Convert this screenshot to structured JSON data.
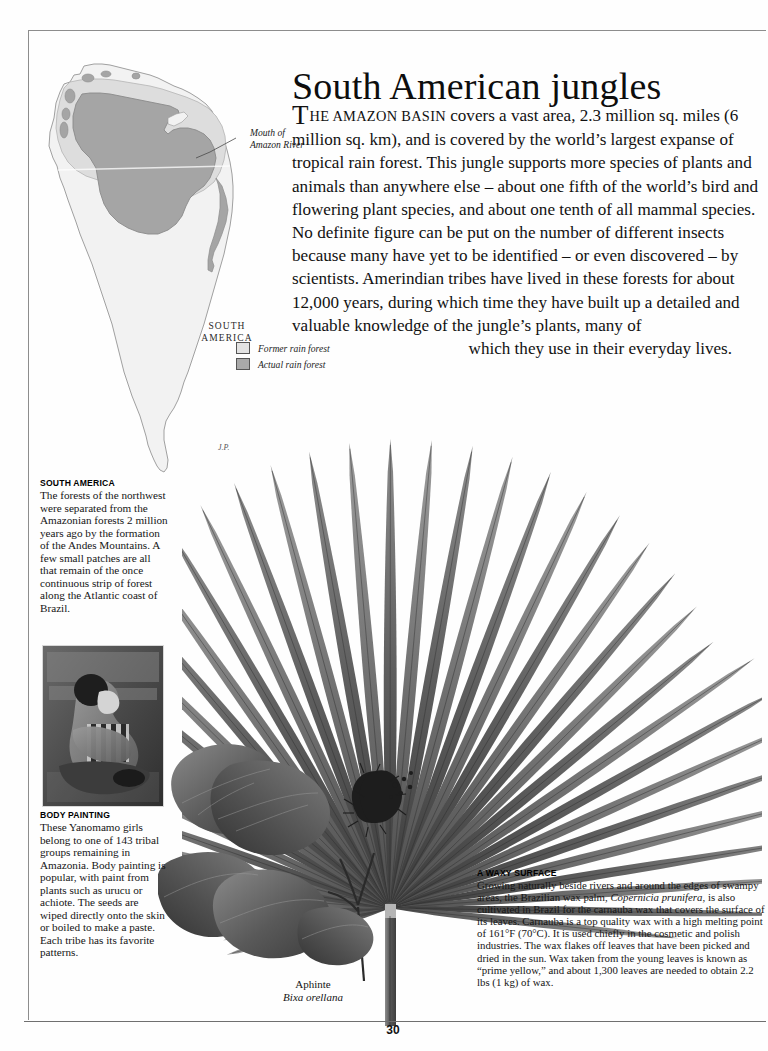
{
  "page": {
    "number": "30",
    "headline": "South American jungles"
  },
  "intro": {
    "dropcap": "T",
    "smallcaps": "HE AMAZON BASIN",
    "body": " covers a vast area, 2.3 million sq. miles (6 million sq. km), and is covered by the world’s largest expanse of tropical rain forest. This jungle supports more species of plants and animals than anywhere else – about one fifth of the world’s bird and flowering plant species, and about one tenth of all mammal species. No definite figure can be put on the number of different insects because many have yet to be identified – or even discovered – by scientists. Amerindian tribes have lived in these forests for about 12,000 years, during which time they have built up a detailed and valuable knowledge of the jungle’s plants, many of ",
    "tail": "which they use in their everyday lives."
  },
  "map": {
    "country_label": "SOUTH AMERICA",
    "callout": "Mouth of Amazon River",
    "callout_line1": "Mouth of",
    "callout_line2": "Amazon River",
    "artist_signature": "J.P.",
    "legend": [
      {
        "label": "Former rain forest",
        "swatch": "#e3e3e3"
      },
      {
        "label": "Actual rain forest",
        "swatch": "#a9a9a9"
      }
    ]
  },
  "captions": {
    "south_america": {
      "title": "SOUTH AMERICA",
      "body": "The forests of the northwest were separated from the Amazonian forests 2 million years ago by the formation of the Andes Mountains. A few small patches are all that remain of the once continuous strip of forest along the Atlantic coast of Brazil."
    },
    "body_painting": {
      "title": "BODY PAINTING",
      "body": "These Yanomamo girls belong to one of 143 tribal groups remaining in Amazonia. Body painting is popular, with paint from plants such as urucu or achiote. The seeds are wiped directly onto the skin or boiled to make a paste. Each tribe has its favorite patterns."
    },
    "waxy_surface": {
      "title": "A WAXY SURFACE",
      "body_part1": "Growing naturally beside rivers and around the edges of swampy areas, the Brazilian wax palm, ",
      "species_italic1": "Copernicia prunifera",
      "body_part2": ", is also cultivated in Brazil for the carnauba wax that covers the surface of its leaves. Carnauba is a top quality wax with a high melting point of 161°F (70°C). It is used chiefly in the cosmetic and polish industries. The wax flakes off leaves that have been picked and dried in the sun. Wax taken from the young leaves is known as “prime yellow,” and about 1,300 leaves are needed to obtain 2.2 lbs (1 kg) of wax."
    }
  },
  "plant_label": {
    "common_name": "Aphinte",
    "latin_name": "Bixa orellana"
  },
  "artwork": {
    "palm_leaf": "fan-palm-leaf-carnauba",
    "annatto_plant": "annatto-bixa-orellana-branch",
    "body_painting_photo": "yanomamo-body-painting-photo"
  },
  "colors": {
    "page_background": "#fdfdfd",
    "text": "#141414",
    "rule": "#6f6f6f",
    "map_land": "#f1f1f1",
    "map_former_forest": "#d9d9d9",
    "map_actual_forest": "#a5a5a5"
  }
}
